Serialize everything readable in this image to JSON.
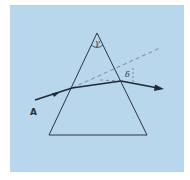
{
  "figure": {
    "background_color": "#b9d7ec",
    "line_color": "#2a3440",
    "dashed_color": "#7a8a99"
  },
  "labels": {
    "apex_angle": "γ",
    "deviation_angle": "δ",
    "incident_point": "A"
  },
  "elements": {
    "prism": "triangular-prism",
    "incident_ray": "ray-from-A",
    "internal_ray": "refracted-ray-inside-prism",
    "exit_ray": "emergent-ray",
    "extension_line": "dashed-extension-of-incident-ray",
    "deviation_marker": "dashed-vertical-deviation-marker"
  }
}
